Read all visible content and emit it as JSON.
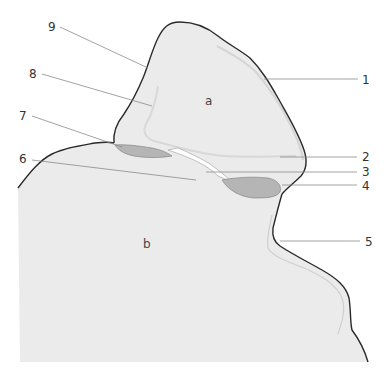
{
  "diagram": {
    "regions": [
      {
        "id": "a",
        "label": "a"
      },
      {
        "id": "b",
        "label": "b"
      }
    ],
    "callouts": [
      {
        "number": "1",
        "side": "right"
      },
      {
        "number": "2",
        "side": "right"
      },
      {
        "number": "3",
        "side": "right"
      },
      {
        "number": "4",
        "side": "right"
      },
      {
        "number": "5",
        "side": "right"
      },
      {
        "number": "6",
        "side": "left"
      },
      {
        "number": "7",
        "side": "left"
      },
      {
        "number": "8",
        "side": "left"
      },
      {
        "number": "9",
        "side": "left"
      }
    ],
    "colors": {
      "fill_region": "#ebebeb",
      "fill_dark_patch": "#b5b5b5",
      "outline": "#2a2a2a",
      "leader_line": "#8a8a8a",
      "inner_contour": "#d2d2d2",
      "background": "#ffffff"
    }
  }
}
